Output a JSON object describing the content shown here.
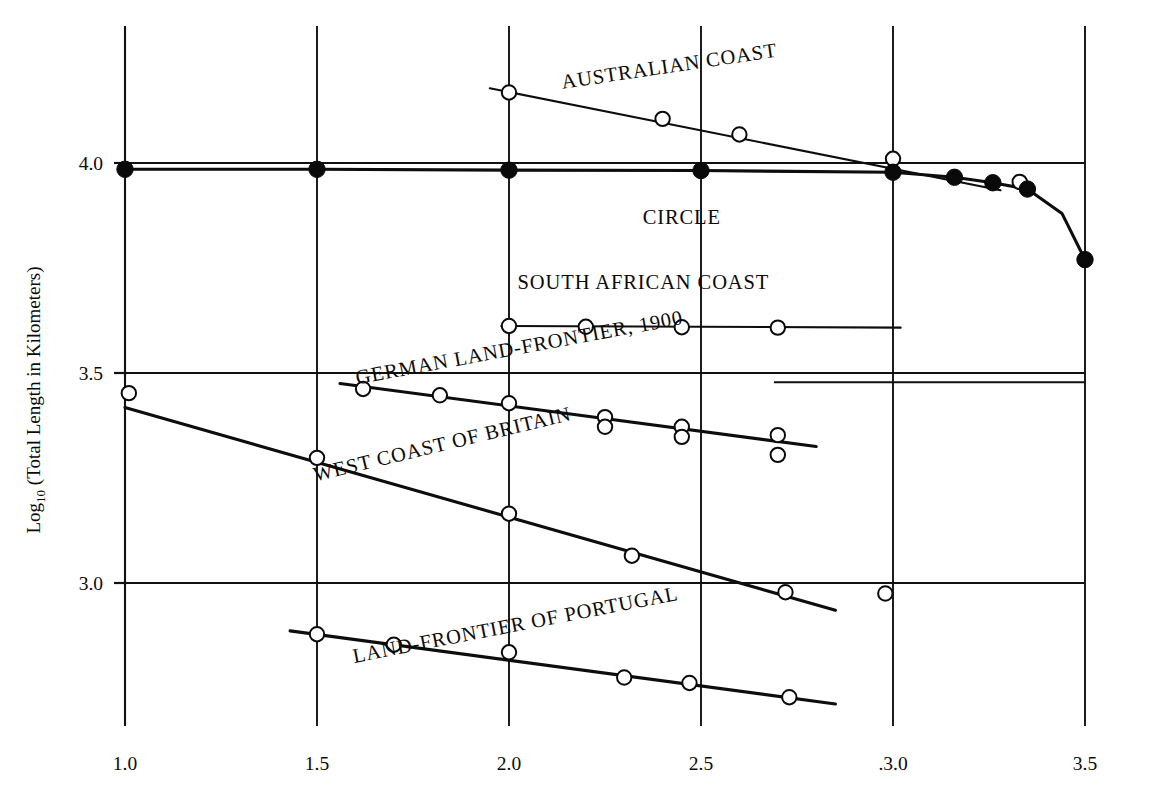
{
  "chart_data": {
    "type": "scatter",
    "title": "",
    "xlabel": "",
    "ylabel_main": "Log",
    "ylabel_sub": "10",
    "ylabel_rest": " (Total Length in Kilometers)",
    "xlim": [
      0.87,
      3.62
    ],
    "ylim": [
      2.62,
      4.31
    ],
    "grid": true,
    "legend": "inline-labels",
    "xticks": [
      "1.0",
      "1.5",
      "2.0",
      "2.5",
      ".3.0",
      "3.5"
    ],
    "xtick_values": [
      1.0,
      1.5,
      2.0,
      2.5,
      3.0,
      3.5
    ],
    "yticks": [
      "4.0",
      "3.5",
      "3.0"
    ],
    "ytick_values": [
      4.0,
      3.5,
      3.0
    ],
    "series": [
      {
        "name": "AUSTRALIAN COAST",
        "label": "AUSTRALIAN COAST",
        "marker": "open-circle",
        "label_x": 2.42,
        "label_y": 4.215,
        "label_rotation": -8.5,
        "trend_x": [
          1.95,
          3.28
        ],
        "trend_y": [
          4.178,
          3.935
        ],
        "points": [
          {
            "x": 2.0,
            "y": 4.168
          },
          {
            "x": 2.4,
            "y": 4.105
          },
          {
            "x": 2.6,
            "y": 4.068
          },
          {
            "x": 3.0,
            "y": 4.01
          },
          {
            "x": 3.33,
            "y": 3.955
          }
        ]
      },
      {
        "name": "CIRCLE",
        "label": "CIRCLE",
        "marker": "filled-circle",
        "label_x": 2.45,
        "label_y": 3.855,
        "label_rotation": 0,
        "curve": [
          {
            "x": 1.0,
            "y": 3.985
          },
          {
            "x": 1.5,
            "y": 3.985
          },
          {
            "x": 2.0,
            "y": 3.983
          },
          {
            "x": 2.5,
            "y": 3.982
          },
          {
            "x": 3.0,
            "y": 3.978
          },
          {
            "x": 3.16,
            "y": 3.966
          },
          {
            "x": 3.26,
            "y": 3.953
          },
          {
            "x": 3.35,
            "y": 3.938
          },
          {
            "x": 3.44,
            "y": 3.88
          },
          {
            "x": 3.5,
            "y": 3.77
          }
        ],
        "points": [
          {
            "x": 1.0,
            "y": 3.985
          },
          {
            "x": 1.5,
            "y": 3.985
          },
          {
            "x": 2.0,
            "y": 3.983
          },
          {
            "x": 2.5,
            "y": 3.982
          },
          {
            "x": 3.0,
            "y": 3.978
          },
          {
            "x": 3.16,
            "y": 3.966
          },
          {
            "x": 3.26,
            "y": 3.953
          },
          {
            "x": 3.35,
            "y": 3.938
          },
          {
            "x": 3.5,
            "y": 3.77
          }
        ]
      },
      {
        "name": "SOUTH AFRICAN COAST",
        "label": "SOUTH AFRICAN COAST",
        "marker": "open-circle",
        "label_x": 2.35,
        "label_y": 3.7,
        "label_rotation": 0,
        "trend_x": [
          1.98,
          3.02
        ],
        "trend_y": [
          3.612,
          3.608
        ],
        "points": [
          {
            "x": 2.0,
            "y": 3.612
          },
          {
            "x": 2.2,
            "y": 3.61
          },
          {
            "x": 2.45,
            "y": 3.609
          },
          {
            "x": 2.7,
            "y": 3.608
          }
        ]
      },
      {
        "name": "GERMAN LAND-FRONTIER, 1900",
        "label": "GERMAN LAND-FRONTIER, 1900",
        "marker": "open-circle",
        "label_x": 2.03,
        "label_y": 3.545,
        "label_rotation": -10.5,
        "trend_x": [
          1.56,
          2.8
        ],
        "trend_y": [
          3.475,
          3.325
        ],
        "points": [
          {
            "x": 1.62,
            "y": 3.462
          },
          {
            "x": 1.82,
            "y": 3.447
          },
          {
            "x": 2.0,
            "y": 3.428
          },
          {
            "x": 2.25,
            "y": 3.395
          },
          {
            "x": 2.25,
            "y": 3.372
          },
          {
            "x": 2.45,
            "y": 3.372
          },
          {
            "x": 2.45,
            "y": 3.348
          },
          {
            "x": 2.7,
            "y": 3.352
          },
          {
            "x": 2.7,
            "y": 3.305
          }
        ]
      },
      {
        "name": "WEST COAST OF BRITAIN",
        "label": "WEST COAST OF BRITAIN",
        "marker": "open-circle",
        "label_x": 1.83,
        "label_y": 3.315,
        "label_rotation": -13.5,
        "trend_x": [
          1.0,
          2.85
        ],
        "trend_y": [
          3.418,
          2.935
        ],
        "points": [
          {
            "x": 1.01,
            "y": 3.452
          },
          {
            "x": 1.5,
            "y": 3.298
          },
          {
            "x": 2.0,
            "y": 3.165
          },
          {
            "x": 2.32,
            "y": 3.065
          },
          {
            "x": 2.72,
            "y": 2.978
          },
          {
            "x": 2.98,
            "y": 2.975
          }
        ]
      },
      {
        "name": "LAND-FRONTIER OF PORTUGAL",
        "label": "LAND-FRONTIER OF PORTUGAL",
        "marker": "open-circle",
        "label_x": 2.02,
        "label_y": 2.885,
        "label_rotation": -11.0,
        "trend_x": [
          1.43,
          2.85
        ],
        "trend_y": [
          2.886,
          2.712
        ],
        "points": [
          {
            "x": 1.5,
            "y": 2.878
          },
          {
            "x": 1.7,
            "y": 2.853
          },
          {
            "x": 2.0,
            "y": 2.835
          },
          {
            "x": 2.3,
            "y": 2.775
          },
          {
            "x": 2.47,
            "y": 2.762
          },
          {
            "x": 2.73,
            "y": 2.728
          }
        ]
      }
    ],
    "extra_gridline": {
      "y": 3.478,
      "x_start": 2.69,
      "x_end": 3.5
    }
  }
}
